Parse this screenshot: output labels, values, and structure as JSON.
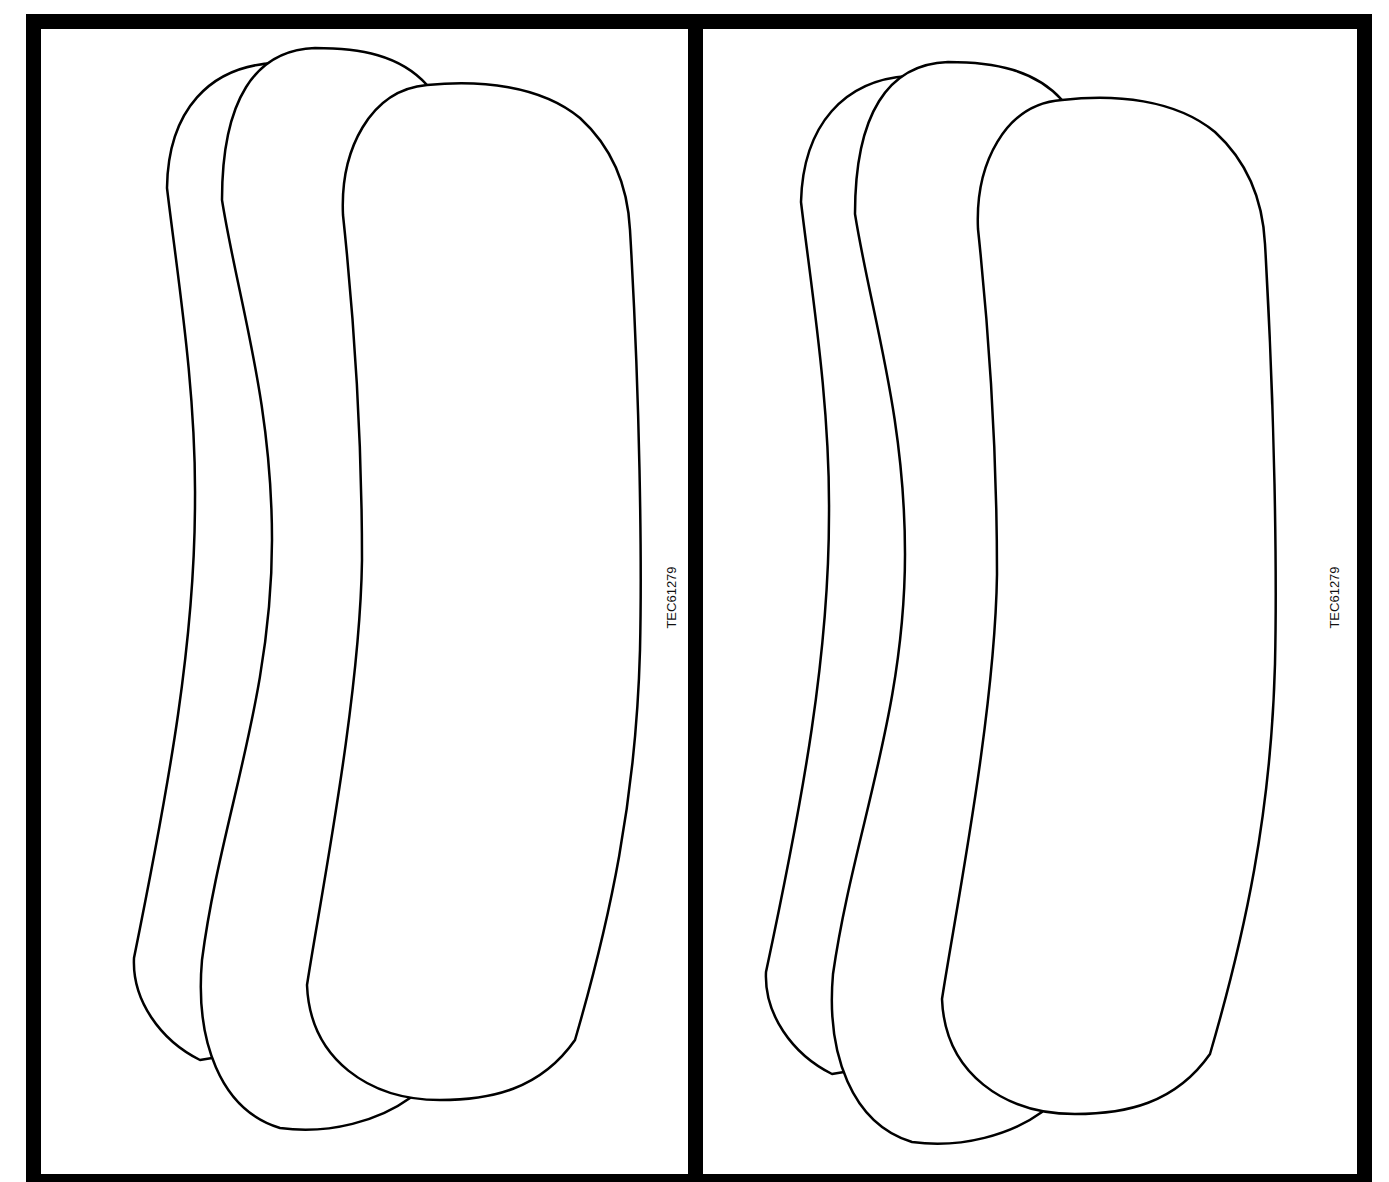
{
  "figure": {
    "panels": [
      {
        "id": "left",
        "code_label": "TEC61279",
        "pads": [
          "back-pad",
          "middle-pad",
          "front-pad"
        ]
      },
      {
        "id": "right",
        "code_label": "TEC61279",
        "pads": [
          "back-pad",
          "middle-pad",
          "front-pad"
        ]
      }
    ],
    "colors": {
      "frame": "#000000",
      "outline": "#000000",
      "background": "#ffffff"
    }
  }
}
